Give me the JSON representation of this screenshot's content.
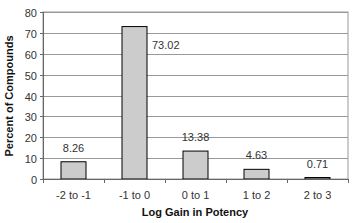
{
  "chart_data": {
    "type": "bar",
    "title": "",
    "xlabel": "Log Gain in Potency",
    "ylabel": "Percent of Compounds",
    "categories": [
      "-2 to -1",
      "-1 to 0",
      "0 to 1",
      "1 to 2",
      "2 to 3"
    ],
    "values": [
      8.26,
      73.02,
      13.38,
      4.63,
      0.71
    ],
    "data_labels": [
      "8.26",
      "73.02",
      "13.38",
      "4.63",
      "0.71"
    ],
    "ylim": [
      0,
      80
    ],
    "yticks": [
      0,
      10,
      20,
      30,
      40,
      50,
      60,
      70,
      80
    ],
    "grid": true,
    "legend": null,
    "bar_color": "#cccccc"
  }
}
